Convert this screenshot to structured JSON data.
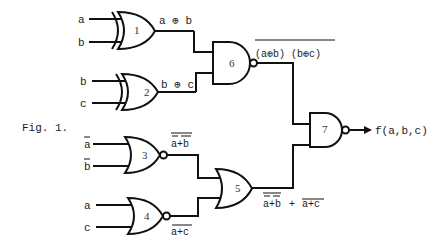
{
  "figure": {
    "caption": "Fig. 1.",
    "output_label": "f(a,b,c)"
  },
  "gates": [
    {
      "id": 1,
      "label": "1",
      "type": "XOR",
      "inputs": [
        "a",
        "b"
      ],
      "output_label": "a ⊕ b"
    },
    {
      "id": 2,
      "label": "2",
      "type": "XOR",
      "inputs": [
        "b",
        "c"
      ],
      "output_label": "b ⊕ c"
    },
    {
      "id": 3,
      "label": "3",
      "type": "NOR",
      "inputs": [
        "ā",
        "b̄"
      ],
      "output_label": "a+b"
    },
    {
      "id": 4,
      "label": "4",
      "type": "NOR",
      "inputs": [
        "a",
        "c"
      ],
      "output_label": "a+c"
    },
    {
      "id": 5,
      "label": "5",
      "type": "OR",
      "inputs": [
        "gate3",
        "gate4"
      ],
      "output_label": "a+b + a+c"
    },
    {
      "id": 6,
      "label": "6",
      "type": "NAND",
      "inputs": [
        "gate1",
        "gate2"
      ],
      "output_label": "(a⊕b) (b⊕c)"
    },
    {
      "id": 7,
      "label": "7",
      "type": "NAND",
      "inputs": [
        "gate6",
        "gate5"
      ],
      "output_label": "f(a,b,c)"
    }
  ],
  "labels": {
    "g1_in_a": "a",
    "g1_in_b": "b",
    "g1_out": "a ⊕ b",
    "g2_in_b": "b",
    "g2_in_c": "c",
    "g2_out": "b ⊕ c",
    "g3_in_a": "a",
    "g3_in_b": "b",
    "g3_out": "a+b",
    "g4_in_a": "a",
    "g4_in_c": "c",
    "g4_out": "a+c",
    "g5_out_left": "a+b",
    "g5_out_plus": "+",
    "g5_out_right": "a+c",
    "g6_out": "(a⊕b) (b⊕c)",
    "g7_out": "f(a,b,c)"
  }
}
